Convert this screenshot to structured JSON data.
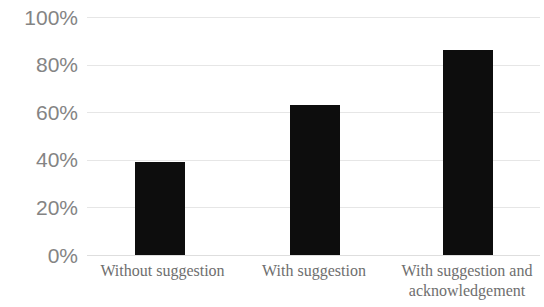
{
  "chart_data": {
    "type": "bar",
    "title": "",
    "subtitle": "",
    "xlabel": "",
    "ylabel": "",
    "categories": [
      "Without suggestion",
      "With suggestion",
      "With suggestion and acknowledgement"
    ],
    "values": [
      39,
      63,
      86
    ],
    "value_labels": [
      "39%",
      "63%",
      "86%"
    ],
    "ylim": [
      0,
      100
    ],
    "y_ticks": [
      0,
      20,
      40,
      60,
      80,
      100
    ],
    "y_tick_labels": [
      "0%",
      "20%",
      "40%",
      "60%",
      "80%",
      "100%"
    ],
    "grid": true,
    "grid_axis": "y",
    "legend": false,
    "legend_position": "none",
    "annotations": [],
    "series": [
      {
        "name": "",
        "values": [
          39,
          63,
          86
        ]
      }
    ]
  },
  "style": {
    "bar_color": "#0d0d0d",
    "gridline_color": "#e6e6e6",
    "baseline_color": "#dedede",
    "y_tick_color": "#848484",
    "x_label_color": "#6e6e6e",
    "background_color": "#ffffff"
  },
  "x_label_lines": [
    [
      "Without suggestion"
    ],
    [
      "With suggestion"
    ],
    [
      "With suggestion and",
      "acknowledgement"
    ]
  ]
}
